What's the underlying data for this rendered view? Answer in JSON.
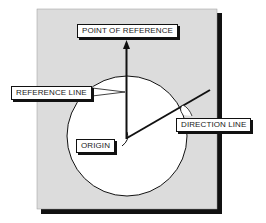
{
  "diagram": {
    "labels": {
      "point_of_reference": "POINT OF REFERENCE",
      "reference_line": "REFERENCE LINE",
      "origin": "ORIGIN",
      "direction_line": "DIRECTION LINE"
    },
    "colors": {
      "panel": "#dcdcdc",
      "shadow": "#111111",
      "circle": "#ffffff",
      "stroke": "#111111"
    }
  }
}
